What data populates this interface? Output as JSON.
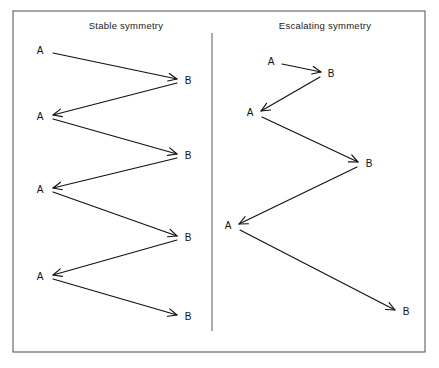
{
  "figure": {
    "background_color": "#ffffff",
    "frame_color": "#5d5d5d",
    "line_color": "#111111",
    "width": 439,
    "height": 368,
    "frame": {
      "x": 13,
      "y": 11,
      "width": 412,
      "height": 341
    },
    "divider": {
      "x": 212,
      "y1": 33,
      "y2": 331
    }
  },
  "panels": [
    {
      "id": "stable-symmetry",
      "title": "Stable symmetry",
      "title_x": 126,
      "title_y": 29,
      "description": "Zig-zag exchange of equal magnitude between A and B",
      "nodes": [
        {
          "label": "A",
          "x": 40,
          "y": 51
        },
        {
          "label": "B",
          "x": 188,
          "y": 81
        },
        {
          "label": "A",
          "x": 40,
          "y": 117
        },
        {
          "label": "B",
          "x": 188,
          "y": 156
        },
        {
          "label": "A",
          "x": 40,
          "y": 190
        },
        {
          "label": "B",
          "x": 188,
          "y": 238
        },
        {
          "label": "A",
          "x": 40,
          "y": 277
        },
        {
          "label": "B",
          "x": 188,
          "y": 317
        }
      ],
      "arrows": [
        {
          "x1": 53,
          "y1": 53,
          "x2": 177,
          "y2": 79,
          "direction": "A-to-B"
        },
        {
          "x1": 177,
          "y1": 83,
          "x2": 53,
          "y2": 115,
          "direction": "B-to-A"
        },
        {
          "x1": 53,
          "y1": 119,
          "x2": 177,
          "y2": 154,
          "direction": "A-to-B"
        },
        {
          "x1": 177,
          "y1": 158,
          "x2": 53,
          "y2": 188,
          "direction": "B-to-A"
        },
        {
          "x1": 53,
          "y1": 192,
          "x2": 177,
          "y2": 236,
          "direction": "A-to-B"
        },
        {
          "x1": 177,
          "y1": 240,
          "x2": 53,
          "y2": 275,
          "direction": "B-to-A"
        },
        {
          "x1": 53,
          "y1": 279,
          "x2": 177,
          "y2": 315,
          "direction": "A-to-B"
        }
      ]
    },
    {
      "id": "escalating-symmetry",
      "title": "Escalating symmetry",
      "title_x": 325,
      "title_y": 29,
      "description": "Zig-zag exchange of increasing magnitude between A and B",
      "nodes": [
        {
          "label": "A",
          "x": 271,
          "y": 62
        },
        {
          "label": "B",
          "x": 331,
          "y": 74
        },
        {
          "label": "A",
          "x": 250,
          "y": 113
        },
        {
          "label": "B",
          "x": 369,
          "y": 164
        },
        {
          "label": "A",
          "x": 228,
          "y": 226
        },
        {
          "label": "B",
          "x": 406,
          "y": 312
        }
      ],
      "arrows": [
        {
          "x1": 282,
          "y1": 64,
          "x2": 321,
          "y2": 72,
          "direction": "A-to-B"
        },
        {
          "x1": 320,
          "y1": 77,
          "x2": 261,
          "y2": 111,
          "direction": "B-to-A"
        },
        {
          "x1": 262,
          "y1": 117,
          "x2": 358,
          "y2": 162,
          "direction": "A-to-B"
        },
        {
          "x1": 357,
          "y1": 167,
          "x2": 239,
          "y2": 224,
          "direction": "B-to-A"
        },
        {
          "x1": 240,
          "y1": 230,
          "x2": 395,
          "y2": 310,
          "direction": "A-to-B"
        }
      ]
    }
  ]
}
